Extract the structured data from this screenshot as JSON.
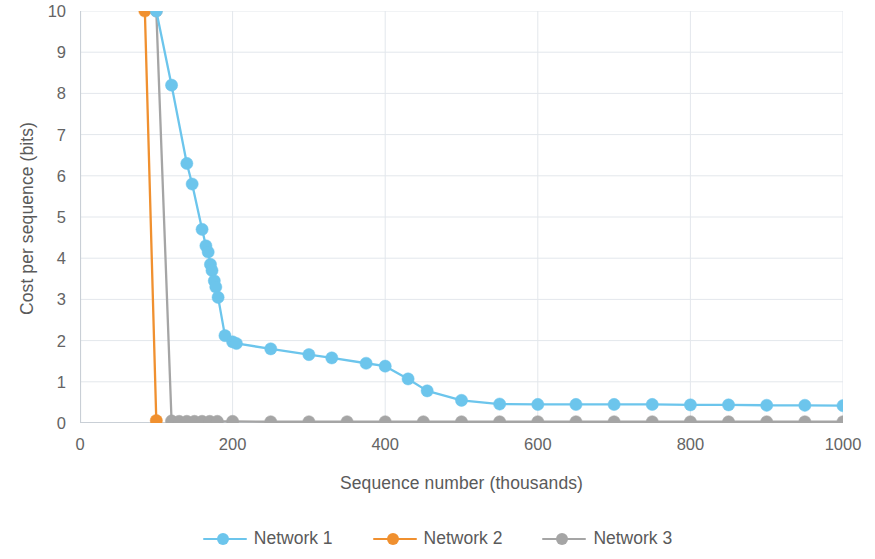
{
  "chart_data": {
    "type": "line",
    "title": "",
    "xlabel": "Sequence number (thousands)",
    "ylabel": "Cost per sequence (bits)",
    "xlim": [
      0,
      1000
    ],
    "ylim": [
      0,
      10
    ],
    "xticks": [
      0,
      200,
      400,
      600,
      800,
      1000
    ],
    "yticks": [
      0,
      1,
      2,
      3,
      4,
      5,
      6,
      7,
      8,
      9,
      10
    ],
    "grid": true,
    "grid_axis": "both",
    "legend_position": "bottom",
    "markers": "circle",
    "series": [
      {
        "name": "Network 1",
        "color": "#6CC5EC",
        "points": [
          [
            100,
            10.0
          ],
          [
            120,
            8.2
          ],
          [
            140,
            6.3
          ],
          [
            147,
            5.8
          ],
          [
            160,
            4.7
          ],
          [
            165,
            4.3
          ],
          [
            168,
            4.15
          ],
          [
            171,
            3.85
          ],
          [
            173,
            3.7
          ],
          [
            176,
            3.45
          ],
          [
            178,
            3.3
          ],
          [
            181,
            3.05
          ],
          [
            190,
            2.12
          ],
          [
            200,
            1.97
          ],
          [
            205,
            1.93
          ],
          [
            250,
            1.8
          ],
          [
            300,
            1.66
          ],
          [
            330,
            1.58
          ],
          [
            375,
            1.45
          ],
          [
            400,
            1.38
          ],
          [
            430,
            1.07
          ],
          [
            455,
            0.78
          ],
          [
            500,
            0.55
          ],
          [
            550,
            0.46
          ],
          [
            600,
            0.45
          ],
          [
            650,
            0.45
          ],
          [
            700,
            0.45
          ],
          [
            750,
            0.45
          ],
          [
            800,
            0.44
          ],
          [
            850,
            0.44
          ],
          [
            900,
            0.43
          ],
          [
            950,
            0.43
          ],
          [
            1000,
            0.42
          ]
        ]
      },
      {
        "name": "Network 2",
        "color": "#F0902F",
        "points": [
          [
            85,
            10.0
          ],
          [
            100,
            0.06
          ]
        ]
      },
      {
        "name": "Network 3",
        "color": "#A5A5A5",
        "points": [
          [
            100,
            10.0
          ],
          [
            120,
            0.05
          ],
          [
            130,
            0.04
          ],
          [
            140,
            0.04
          ],
          [
            150,
            0.04
          ],
          [
            160,
            0.04
          ],
          [
            170,
            0.04
          ],
          [
            180,
            0.04
          ],
          [
            200,
            0.04
          ],
          [
            250,
            0.03
          ],
          [
            300,
            0.03
          ],
          [
            350,
            0.03
          ],
          [
            400,
            0.03
          ],
          [
            450,
            0.03
          ],
          [
            500,
            0.03
          ],
          [
            550,
            0.03
          ],
          [
            600,
            0.03
          ],
          [
            650,
            0.03
          ],
          [
            700,
            0.03
          ],
          [
            750,
            0.03
          ],
          [
            800,
            0.03
          ],
          [
            850,
            0.03
          ],
          [
            900,
            0.03
          ],
          [
            950,
            0.03
          ],
          [
            1000,
            0.03
          ]
        ]
      }
    ]
  },
  "legend": {
    "items": [
      {
        "label": "Network 1",
        "color": "#6CC5EC"
      },
      {
        "label": "Network 2",
        "color": "#F0902F"
      },
      {
        "label": "Network 3",
        "color": "#A5A5A5"
      }
    ]
  },
  "style": {
    "grid_color": "#E3E7EC",
    "axis_color": "#C9CFD6",
    "tick_text_color": "#646464",
    "title_text_color": "#5A5A5A",
    "plot_background": "#FFFFFF"
  }
}
